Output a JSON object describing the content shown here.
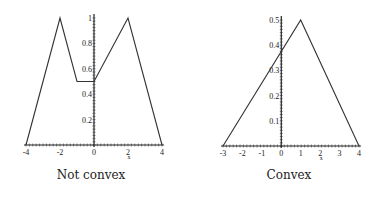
{
  "chart_data": [
    {
      "type": "line",
      "title": "",
      "caption": "Not convex",
      "xlabel": "x",
      "ylabel": "",
      "xlim": [
        -4,
        4
      ],
      "ylim": [
        0,
        1
      ],
      "grid": false,
      "legend": null,
      "x_ticks": [
        "-4",
        "-2",
        "0",
        "2",
        "4"
      ],
      "y_ticks": [
        "0.2",
        "0.4",
        "0.6",
        "0.8",
        "1"
      ],
      "series": [
        {
          "name": "f",
          "x": [
            -4,
            -2,
            -1,
            0,
            2,
            4
          ],
          "y": [
            0,
            1,
            0.5,
            0.5,
            1,
            0
          ]
        }
      ]
    },
    {
      "type": "line",
      "title": "",
      "caption": "Convex",
      "xlabel": "x",
      "ylabel": "",
      "xlim": [
        -3,
        4
      ],
      "ylim": [
        0,
        0.5
      ],
      "grid": false,
      "legend": null,
      "x_ticks": [
        "-3",
        "-2",
        "-1",
        "0",
        "1",
        "2",
        "3",
        "4"
      ],
      "y_ticks": [
        "0.1",
        "0.2",
        "0.3",
        "0.4",
        "0.5"
      ],
      "series": [
        {
          "name": "g",
          "x": [
            -3,
            1,
            4
          ],
          "y": [
            0,
            0.5,
            0
          ]
        }
      ]
    }
  ],
  "captions": {
    "left": "Not convex",
    "right": "Convex"
  }
}
